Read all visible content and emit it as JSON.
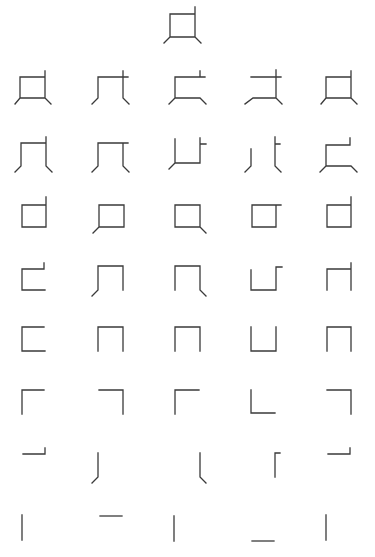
{
  "figure": {
    "stroke_color": "#3a3a3a",
    "background": "#ffffff",
    "glyphs": [
      {
        "row": 0,
        "col": 2,
        "x": 170,
        "y": 10,
        "d": "M0 4 H25 M25 -3 V27 M0 4 V27 H25 M0 27 L-6 33 M25 27 L31 33"
      },
      {
        "row": 1,
        "col": 0,
        "x": 20,
        "y": 73,
        "d": "M0 4 H25 M25 -2 V25 M0 4 V25 H25 M0 25 L-5 31 M25 25 L31 31"
      },
      {
        "row": 1,
        "col": 1,
        "x": 98,
        "y": 73,
        "d": "M0 4 H30 M25 -2 V25 L31 31 M0 4 V25 L-6 31"
      },
      {
        "row": 1,
        "col": 2,
        "x": 175,
        "y": 73,
        "d": "M0 4 H30 M25 -2 V4 M0 4 V25 H25 L31 31 M0 25 L-6 31"
      },
      {
        "row": 1,
        "col": 3,
        "x": 251,
        "y": 73,
        "d": "M0 4 H30 M25 -3 V25 L31 31 M25 25 H2 L-6 31"
      },
      {
        "row": 1,
        "col": 4,
        "x": 326,
        "y": 73,
        "d": "M0 4 H25 M25 -2 V25 M0 4 V25 H25 M0 25 L-5 31 M25 25 L31 31"
      },
      {
        "row": 2,
        "col": 0,
        "x": 21,
        "y": 139,
        "d": "M0 4 H25 M25 -2 V27 L31 33 M0 4 V27 L-6 33"
      },
      {
        "row": 2,
        "col": 1,
        "x": 98,
        "y": 139,
        "d": "M0 4 H30 M25 4 V27 L31 33 M0 4 V27 L-6 33"
      },
      {
        "row": 2,
        "col": 2,
        "x": 175,
        "y": 139,
        "d": "M0 0 V24 H25 V-1 M25 5 H31 M0 24 L-6 30"
      },
      {
        "row": 2,
        "col": 3,
        "x": 251,
        "y": 139,
        "d": "M0 10 V27 L-6 33 M24 -2 V27 L30 33 M24 5 H29"
      },
      {
        "row": 2,
        "col": 4,
        "x": 326,
        "y": 139,
        "d": "M0 6 V27 H25 L31 33 M0 6 H24 V-1 M0 27 L-6 33"
      },
      {
        "row": 3,
        "col": 0,
        "x": 22,
        "y": 201,
        "d": "M0 4 H24 V26 H0 Z M24 4 V-4"
      },
      {
        "row": 3,
        "col": 1,
        "x": 99,
        "y": 201,
        "d": "M0 4 H25 V26 H0 Z M0 26 L-6 32"
      },
      {
        "row": 3,
        "col": 2,
        "x": 175,
        "y": 201,
        "d": "M0 4 H25 V26 H0 Z M25 26 L31 32"
      },
      {
        "row": 3,
        "col": 3,
        "x": 252,
        "y": 201,
        "d": "M0 4 H29 M24 4 V26 H0 V4"
      },
      {
        "row": 3,
        "col": 4,
        "x": 327,
        "y": 201,
        "d": "M0 4 H24 V26 H0 Z M24 4 V-4"
      },
      {
        "row": 4,
        "col": 0,
        "x": 22,
        "y": 264,
        "d": "M0 5 H22 V-1 M0 5 V26 H23"
      },
      {
        "row": 4,
        "col": 1,
        "x": 98,
        "y": 264,
        "d": "M0 2 H25 V26 M0 2 V26 L-6 32"
      },
      {
        "row": 4,
        "col": 2,
        "x": 175,
        "y": 264,
        "d": "M0 2 H25 V26 L31 32 M0 2 V26"
      },
      {
        "row": 4,
        "col": 3,
        "x": 251,
        "y": 264,
        "d": "M0 6 V26 H25 V3 H31"
      },
      {
        "row": 4,
        "col": 4,
        "x": 327,
        "y": 264,
        "d": "M0 5 H24 M24 -1 V26 M0 5 V26"
      },
      {
        "row": 5,
        "col": 0,
        "x": 22,
        "y": 327,
        "d": "M22 0 H0 V24 H23"
      },
      {
        "row": 5,
        "col": 1,
        "x": 98,
        "y": 327,
        "d": "M0 24 V0 H25 V24"
      },
      {
        "row": 5,
        "col": 2,
        "x": 175,
        "y": 327,
        "d": "M0 24 V0 H25 V24"
      },
      {
        "row": 5,
        "col": 3,
        "x": 251,
        "y": 327,
        "d": "M0 0 V24 H25 V0"
      },
      {
        "row": 5,
        "col": 4,
        "x": 327,
        "y": 327,
        "d": "M0 24 V0 H24 V24"
      },
      {
        "row": 6,
        "col": 0,
        "x": 22,
        "y": 390,
        "d": "M0 24 V0 H22"
      },
      {
        "row": 6,
        "col": 1,
        "x": 99,
        "y": 390,
        "d": "M0 0 H24 V24"
      },
      {
        "row": 6,
        "col": 2,
        "x": 175,
        "y": 390,
        "d": "M0 24 V0 H24"
      },
      {
        "row": 6,
        "col": 3,
        "x": 251,
        "y": 390,
        "d": "M0 0 V23 H24"
      },
      {
        "row": 6,
        "col": 4,
        "x": 327,
        "y": 390,
        "d": "M0 0 H24 V24"
      },
      {
        "row": 7,
        "col": 0,
        "x": 23,
        "y": 448,
        "d": "M0 6 H22 V0"
      },
      {
        "row": 7,
        "col": 1,
        "x": 98,
        "y": 453,
        "d": "M0 0 V24 L-6 30"
      },
      {
        "row": 7,
        "col": 2,
        "x": 200,
        "y": 453,
        "d": "M0 0 V24 L6 30"
      },
      {
        "row": 7,
        "col": 3,
        "x": 275,
        "y": 453,
        "d": "M0 24 V0 H5"
      },
      {
        "row": 7,
        "col": 4,
        "x": 328,
        "y": 448,
        "d": "M0 6 H22 V0"
      },
      {
        "row": 8,
        "col": 0,
        "x": 22,
        "y": 515,
        "d": "M0 0 V25"
      },
      {
        "row": 8,
        "col": 1,
        "x": 100,
        "y": 516,
        "d": "M0 0 H22"
      },
      {
        "row": 8,
        "col": 2,
        "x": 174,
        "y": 516,
        "d": "M0 0 V25"
      },
      {
        "row": 8,
        "col": 3,
        "x": 252,
        "y": 541,
        "d": "M0 0 H22"
      },
      {
        "row": 8,
        "col": 4,
        "x": 326,
        "y": 515,
        "d": "M0 0 V25"
      }
    ]
  }
}
